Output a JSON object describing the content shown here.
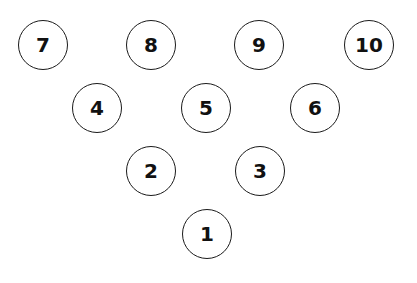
{
  "diagram": {
    "title": "",
    "type": "bowling-pin-layout",
    "pins": [
      {
        "label": "7",
        "x": 43,
        "y": 45
      },
      {
        "label": "8",
        "x": 151,
        "y": 45
      },
      {
        "label": "9",
        "x": 259,
        "y": 45
      },
      {
        "label": "10",
        "x": 369,
        "y": 45
      },
      {
        "label": "4",
        "x": 97,
        "y": 108
      },
      {
        "label": "5",
        "x": 206,
        "y": 108
      },
      {
        "label": "6",
        "x": 315,
        "y": 108
      },
      {
        "label": "2",
        "x": 151,
        "y": 171
      },
      {
        "label": "3",
        "x": 260,
        "y": 171
      },
      {
        "label": "1",
        "x": 207,
        "y": 234
      }
    ],
    "colors": {
      "stroke": "#1a1a1a",
      "text": "#111111",
      "background": "#ffffff"
    }
  }
}
